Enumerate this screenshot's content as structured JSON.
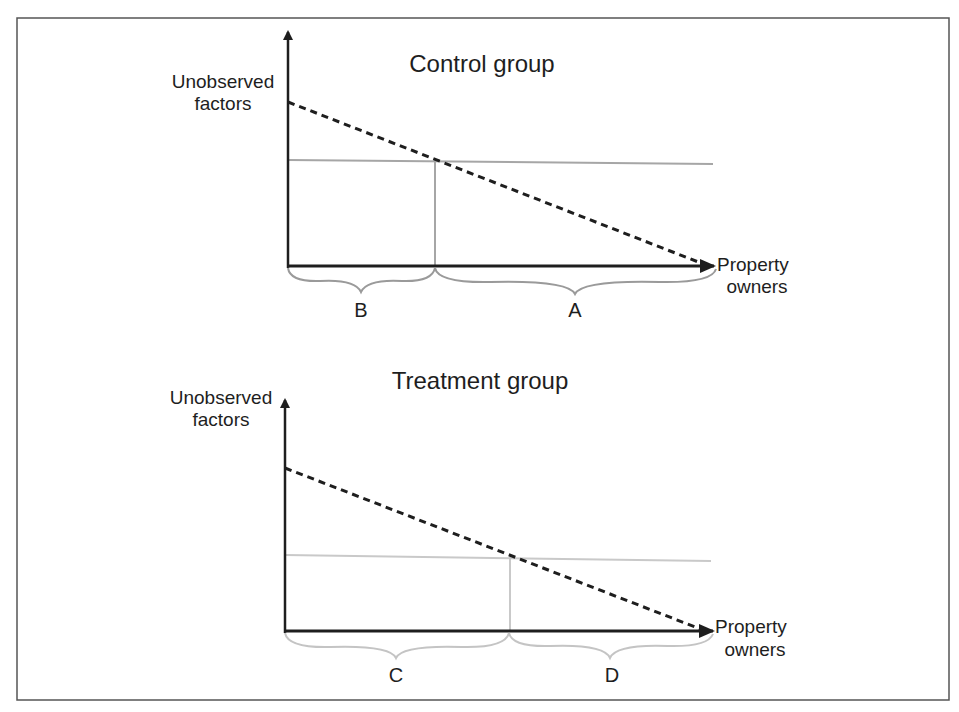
{
  "colors": {
    "frame": "#555555",
    "axis": "#1e1e1e",
    "dashed": "#1e1e1e",
    "control_threshold": "#a6a6a6",
    "treatment_threshold": "#c9c9c9",
    "control_brace": "#9a9a9a",
    "treatment_brace": "#c4c4c4"
  },
  "panels": [
    {
      "id": "control",
      "title": "Control group",
      "y_axis_label": [
        "Unobserved",
        "factors"
      ],
      "x_axis_label": [
        "Property",
        "owners"
      ],
      "regions": [
        {
          "label": "B",
          "position": "left of threshold"
        },
        {
          "label": "A",
          "position": "right of threshold"
        }
      ]
    },
    {
      "id": "treatment",
      "title": "Treatment group",
      "y_axis_label": [
        "Unobserved",
        "factors"
      ],
      "x_axis_label": [
        "Property",
        "owners"
      ],
      "regions": [
        {
          "label": "C",
          "position": "left of threshold"
        },
        {
          "label": "D",
          "position": "right of threshold"
        }
      ]
    }
  ]
}
